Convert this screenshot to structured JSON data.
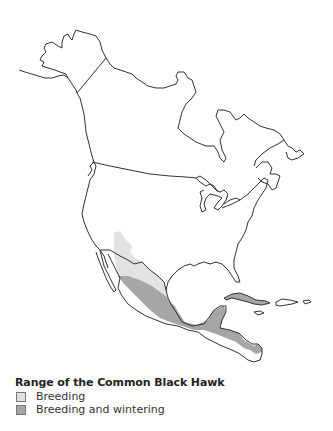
{
  "map": {
    "region": "North America",
    "colors": {
      "outline": "#333333",
      "breeding": "#e2e2e2",
      "breeding_and_wintering": "#a6a6a6",
      "background": "#ffffff"
    }
  },
  "legend": {
    "title": "Range of the Common Black Hawk",
    "items": [
      {
        "label": "Breeding",
        "color": "#e2e2e2"
      },
      {
        "label": "Breeding and wintering",
        "color": "#a6a6a6"
      }
    ]
  }
}
